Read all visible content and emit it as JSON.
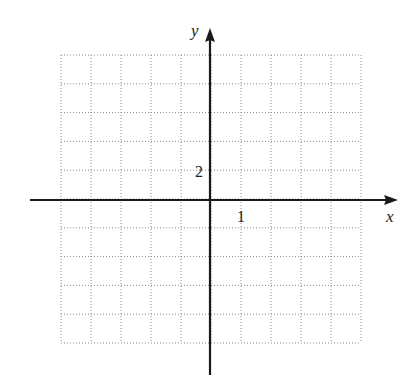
{
  "chart_data": {
    "type": "line",
    "title": "",
    "xlabel": "x",
    "ylabel": "y",
    "xlim": [
      -5,
      5
    ],
    "ylim": [
      -10,
      10
    ],
    "x_step": 1,
    "y_step": 2,
    "grid": true,
    "grid_style": "dotted",
    "tick_labels": [
      {
        "axis": "x",
        "value": 1,
        "label": "1"
      },
      {
        "axis": "y",
        "value": 2,
        "label": "2"
      }
    ],
    "series": []
  },
  "axes": {
    "x_label": "x",
    "y_label": "y",
    "x_tick_label": "1",
    "y_tick_label": "2"
  },
  "colors": {
    "axis": "#1a1a1a",
    "grid": "#8a8a8a",
    "text": "#222222",
    "background": "#ffffff"
  }
}
